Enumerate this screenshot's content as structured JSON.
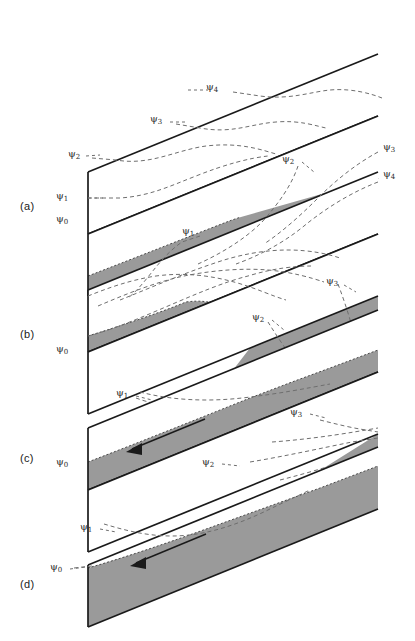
{
  "figure": {
    "type": "scientific-diagram",
    "background_color": "#ffffff",
    "line_color": "#1a1a1a",
    "dash_color": "#6e6e6e",
    "fill_color": "#9a9a9a",
    "slab_geometry": {
      "slope_dx": 290,
      "slope_dy": -118,
      "left_edge_height": 62,
      "thickness_offset_x": 0,
      "thickness_offset_y": 0
    }
  },
  "panels": [
    {
      "id": "a",
      "label": "(a)",
      "label_x": 20,
      "label_y": 208,
      "slabs": [
        {
          "name": "upper-slab",
          "x": 88,
          "y": 172,
          "w": 290,
          "h": 62,
          "dy": -118,
          "fill_fraction": 0.0
        },
        {
          "name": "lower-slab",
          "x": 88,
          "y": 234,
          "w": 290,
          "h": 62,
          "dy": -118,
          "fill_fraction": 0.3
        }
      ],
      "psi_labels": [
        {
          "text": "ψ",
          "sub": "4",
          "x": 212,
          "y": 88
        },
        {
          "text": "ψ",
          "sub": "3",
          "x": 154,
          "y": 120
        },
        {
          "text": "ψ",
          "sub": "2",
          "x": 72,
          "y": 156
        },
        {
          "text": "ψ",
          "sub": "1",
          "x": 58,
          "y": 196
        },
        {
          "text": "ψ",
          "sub": "0",
          "x": 58,
          "y": 220
        }
      ],
      "arrow": null
    },
    {
      "id": "b",
      "label": "(b)",
      "label_x": 20,
      "label_y": 335,
      "slabs": [
        {
          "name": "upper-slab",
          "x": 88,
          "y": 290,
          "w": 290,
          "h": 62,
          "dy": -118,
          "fill_fraction": 0.26
        },
        {
          "name": "lower-slab",
          "x": 88,
          "y": 352,
          "w": 290,
          "h": 62,
          "dy": -118,
          "fill_fraction": 0.36
        }
      ],
      "psi_labels": [
        {
          "text": "ψ",
          "sub": "2",
          "x": 280,
          "y": 160
        },
        {
          "text": "ψ",
          "sub": "3",
          "x": 383,
          "y": 148
        },
        {
          "text": "ψ",
          "sub": "4",
          "x": 383,
          "y": 175
        },
        {
          "text": "ψ",
          "sub": "1",
          "x": 180,
          "y": 232
        },
        {
          "text": "ψ",
          "sub": "0",
          "x": 58,
          "y": 350
        },
        {
          "text": "ψ",
          "sub": "3",
          "x": 328,
          "y": 282
        },
        {
          "text": "ψ",
          "sub": "2",
          "x": 252,
          "y": 318
        },
        {
          "text": "ψ",
          "sub": "1",
          "x": 118,
          "y": 394
        }
      ],
      "arrow": null
    },
    {
      "id": "c",
      "label": "(c)",
      "label_x": 20,
      "label_y": 460,
      "slabs": [
        {
          "name": "upper-slab",
          "x": 88,
          "y": 428,
          "w": 290,
          "h": 62,
          "dy": -118,
          "fill_fraction": 0.55
        },
        {
          "name": "lower-slab",
          "x": 88,
          "y": 490,
          "w": 290,
          "h": 62,
          "dy": -118,
          "fill_fraction": 0.58
        }
      ],
      "psi_labels": [
        {
          "text": "ψ",
          "sub": "0",
          "x": 58,
          "y": 463
        },
        {
          "text": "ψ",
          "sub": "3",
          "x": 290,
          "y": 413
        },
        {
          "text": "ψ",
          "sub": "2",
          "x": 200,
          "y": 462
        }
      ],
      "arrow": {
        "x1": 200,
        "y1": 421,
        "x2": 128,
        "y2": 450,
        "direction": "down-left"
      }
    },
    {
      "id": "d",
      "label": "(d)",
      "label_x": 20,
      "label_y": 585,
      "slabs": [
        {
          "name": "main-slab",
          "x": 88,
          "y": 565,
          "w": 290,
          "h": 62,
          "dy": -118,
          "fill_fraction": 0.8
        }
      ],
      "psi_labels": [
        {
          "text": "ψ",
          "sub": "1",
          "x": 82,
          "y": 528
        },
        {
          "text": "ψ",
          "sub": "0",
          "x": 52,
          "y": 568
        }
      ],
      "arrow": {
        "x1": 204,
        "y1": 535,
        "x2": 132,
        "y2": 565,
        "direction": "down-left"
      }
    }
  ],
  "legend_symbols": {
    "psi_symbol": "ψ",
    "streamfunction_levels": [
      "0",
      "1",
      "2",
      "3",
      "4"
    ]
  }
}
